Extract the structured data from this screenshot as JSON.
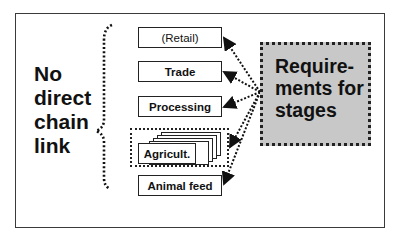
{
  "diagram": {
    "left_label": [
      "No",
      "direct",
      "chain",
      "link"
    ],
    "stages": [
      {
        "label": "(Retail)",
        "bold": false
      },
      {
        "label": "Trade",
        "bold": true
      },
      {
        "label": "Processing",
        "bold": true
      },
      {
        "label": "Agricult.",
        "bold": true,
        "stacked": true
      },
      {
        "label": "Animal feed",
        "bold": true
      }
    ],
    "requirements_box": {
      "lines": [
        "Require-",
        "ments for",
        "stages"
      ],
      "fill_color": "#c8c8c8"
    },
    "connector_style": "dotted arrows from requirements box to each stage",
    "brace_style": "dotted curly brace"
  }
}
